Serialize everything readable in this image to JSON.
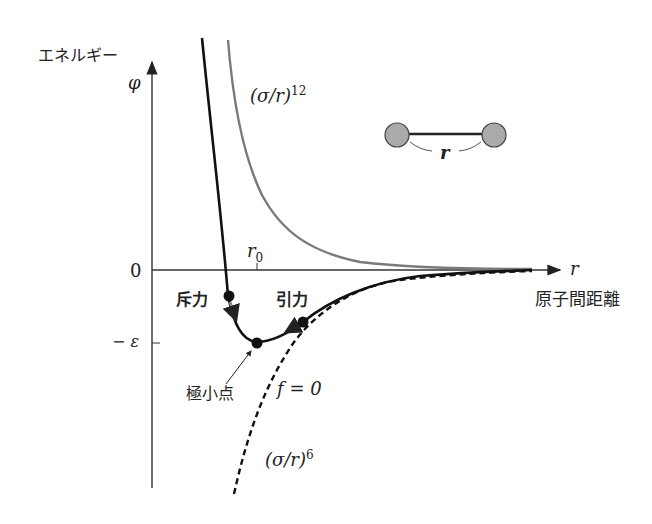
{
  "axes": {
    "y_label_jp": "エネルギー",
    "y_symbol": "φ",
    "x_symbol": "r",
    "x_label_jp": "原子間距離",
    "zero_label": "0",
    "r0_label": "r",
    "r0_subscript": "0",
    "minus_epsilon_label": "− ε"
  },
  "curves": {
    "repulsive": {
      "label_base": "(σ/r)",
      "label_exp": "12",
      "color": "#777777",
      "style": "solid-gray"
    },
    "attractive": {
      "label_base": "(σ/r)",
      "label_exp": "6",
      "color": "#111111",
      "style": "dashed"
    },
    "total": {
      "color": "#111111",
      "style": "solid-black"
    }
  },
  "annotations": {
    "repulsion": "斥力",
    "attraction": "引力",
    "minimum": "極小点",
    "force_zero": "f = 0"
  },
  "inset": {
    "distance_label": "r",
    "atom_color": "#aaaaaa"
  },
  "colors": {
    "axis": "#333333",
    "arrow_gray": "#888888"
  }
}
